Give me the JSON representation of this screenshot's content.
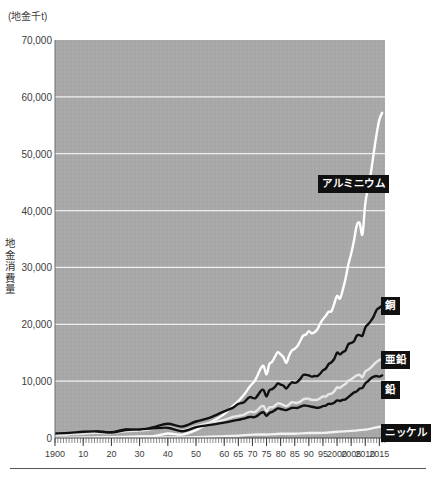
{
  "figure": {
    "unit_label": "(地金千t)",
    "y_axis_title": "地金消費量",
    "plot": {
      "x": 55,
      "y": 40,
      "width": 330,
      "height": 398
    },
    "background_color": "#a8a8a8",
    "gridline_color": "#f0f0f0",
    "axis_text_color": "#3c3c3c",
    "label_box_color": "#101010",
    "label_text_color": "#ffffff"
  },
  "chart_data": {
    "type": "line",
    "title": "",
    "subtitle": "",
    "xlabel": "",
    "ylabel": "地金消費量",
    "unit": "地金千t",
    "xlim": [
      1900,
      2017
    ],
    "ylim": [
      0,
      70000
    ],
    "grid": true,
    "grid_axis": "y",
    "legend_position": "inline-right",
    "y_ticks": [
      0,
      10000,
      20000,
      30000,
      40000,
      50000,
      60000,
      70000
    ],
    "y_tick_labels": [
      "0",
      "10,000",
      "20,000",
      "30,000",
      "40,000",
      "50,000",
      "60,000",
      "70,000"
    ],
    "x_ticks": [
      1900,
      1910,
      1920,
      1930,
      1940,
      1950,
      1960,
      1965,
      1970,
      1975,
      1980,
      1985,
      1990,
      1995,
      2000,
      2005,
      2010,
      2015
    ],
    "x_tick_labels": [
      "1900",
      "10",
      "20",
      "30",
      "40",
      "50",
      "60",
      "65",
      "70",
      "75",
      "80",
      "85",
      "90",
      "95",
      "2000",
      "2005",
      "2010",
      "2015"
    ],
    "series": [
      {
        "name": "アルミニウム",
        "color": "#ffffff",
        "label_x": 318,
        "label_y": 175,
        "x": [
          1900,
          1905,
          1910,
          1915,
          1920,
          1925,
          1930,
          1935,
          1940,
          1945,
          1950,
          1955,
          1960,
          1963,
          1965,
          1967,
          1969,
          1971,
          1973,
          1974,
          1975,
          1976,
          1977,
          1978,
          1979,
          1980,
          1981,
          1982,
          1983,
          1984,
          1985,
          1986,
          1987,
          1988,
          1989,
          1990,
          1991,
          1992,
          1993,
          1994,
          1995,
          1996,
          1997,
          1998,
          1999,
          2000,
          2001,
          2002,
          2003,
          2004,
          2005,
          2006,
          2007,
          2008,
          2009,
          2010,
          2011,
          2012,
          2013,
          2014,
          2015,
          2016
        ],
        "values": [
          5,
          12,
          45,
          100,
          130,
          180,
          270,
          340,
          800,
          600,
          1400,
          2700,
          4200,
          5600,
          6500,
          7600,
          9000,
          10200,
          12300,
          12600,
          11200,
          13000,
          13400,
          14300,
          15100,
          14700,
          14200,
          13200,
          14500,
          15400,
          15700,
          16200,
          17100,
          18000,
          18200,
          18800,
          18400,
          18600,
          19100,
          20100,
          20900,
          21500,
          22200,
          22300,
          23600,
          25000,
          24500,
          26000,
          28000,
          30500,
          32400,
          34700,
          37400,
          37800,
          35800,
          41200,
          44100,
          46700,
          50100,
          53400,
          56000,
          57200
        ]
      },
      {
        "name": "銅",
        "color": "#111111",
        "label_x": 381,
        "label_y": 297,
        "x": [
          1900,
          1905,
          1910,
          1915,
          1920,
          1925,
          1930,
          1935,
          1940,
          1945,
          1950,
          1955,
          1960,
          1963,
          1965,
          1967,
          1969,
          1971,
          1973,
          1974,
          1975,
          1976,
          1977,
          1978,
          1979,
          1980,
          1981,
          1982,
          1983,
          1984,
          1985,
          1986,
          1987,
          1988,
          1989,
          1990,
          1991,
          1992,
          1993,
          1994,
          1995,
          1996,
          1997,
          1998,
          1999,
          2000,
          2001,
          2002,
          2003,
          2004,
          2005,
          2006,
          2007,
          2008,
          2009,
          2010,
          2011,
          2012,
          2013,
          2014,
          2015,
          2016
        ],
        "values": [
          500,
          650,
          900,
          1100,
          1000,
          1500,
          1400,
          1900,
          2500,
          2000,
          2900,
          3600,
          4700,
          5300,
          6000,
          6300,
          7200,
          7000,
          8300,
          8400,
          7300,
          8400,
          8600,
          9000,
          9600,
          9400,
          9200,
          8700,
          9300,
          9800,
          9700,
          9900,
          10400,
          11100,
          11100,
          11000,
          10800,
          10900,
          10900,
          11300,
          11900,
          12200,
          13000,
          13300,
          13900,
          15000,
          14700,
          15100,
          15400,
          16500,
          16700,
          17000,
          18000,
          18100,
          18000,
          19400,
          20000,
          20600,
          21400,
          22500,
          22900,
          23300
        ]
      },
      {
        "name": "亜鉛",
        "color": "#e8e8e8",
        "label_x": 381,
        "label_y": 351,
        "x": [
          1900,
          1905,
          1910,
          1915,
          1920,
          1925,
          1930,
          1935,
          1940,
          1945,
          1950,
          1955,
          1960,
          1963,
          1965,
          1967,
          1969,
          1971,
          1973,
          1974,
          1975,
          1976,
          1977,
          1978,
          1979,
          1980,
          1981,
          1982,
          1983,
          1984,
          1985,
          1986,
          1987,
          1988,
          1989,
          1990,
          1991,
          1992,
          1993,
          1994,
          1995,
          1996,
          1997,
          1998,
          1999,
          2000,
          2001,
          2002,
          2003,
          2004,
          2005,
          2006,
          2007,
          2008,
          2009,
          2010,
          2011,
          2012,
          2013,
          2014,
          2015,
          2016
        ],
        "values": [
          450,
          600,
          800,
          900,
          850,
          1200,
          1300,
          1600,
          1900,
          1300,
          2100,
          2700,
          3200,
          3700,
          3900,
          4100,
          4600,
          4600,
          5500,
          5600,
          4700,
          5400,
          5400,
          5700,
          6100,
          6000,
          5800,
          5600,
          5900,
          6300,
          6200,
          6200,
          6400,
          6800,
          6900,
          6900,
          6700,
          6700,
          6700,
          7000,
          7300,
          7300,
          7700,
          7800,
          8200,
          8900,
          8800,
          9200,
          9500,
          10100,
          10300,
          10700,
          11000,
          11100,
          10700,
          11700,
          12000,
          12400,
          12900,
          13400,
          13700,
          13900
        ]
      },
      {
        "name": "鉛",
        "color": "#111111",
        "label_x": 381,
        "label_y": 381,
        "x": [
          1900,
          1905,
          1910,
          1915,
          1920,
          1925,
          1930,
          1935,
          1940,
          1945,
          1950,
          1955,
          1960,
          1963,
          1965,
          1967,
          1969,
          1971,
          1973,
          1974,
          1975,
          1976,
          1977,
          1978,
          1979,
          1980,
          1981,
          1982,
          1983,
          1984,
          1985,
          1986,
          1987,
          1988,
          1989,
          1990,
          1991,
          1992,
          1993,
          1994,
          1995,
          1996,
          1997,
          1998,
          1999,
          2000,
          2001,
          2002,
          2003,
          2004,
          2005,
          2006,
          2007,
          2008,
          2009,
          2010,
          2011,
          2012,
          2013,
          2014,
          2015,
          2016
        ],
        "values": [
          800,
          900,
          1100,
          1150,
          950,
          1400,
          1500,
          1700,
          1800,
          1200,
          1900,
          2300,
          2700,
          3000,
          3200,
          3400,
          3700,
          3700,
          4400,
          4500,
          3900,
          4400,
          4600,
          4900,
          5200,
          5100,
          5000,
          4900,
          5100,
          5300,
          5300,
          5300,
          5500,
          5700,
          5700,
          5600,
          5500,
          5400,
          5300,
          5400,
          5600,
          5700,
          6000,
          6000,
          6200,
          6600,
          6500,
          6700,
          6800,
          7200,
          7600,
          8000,
          8200,
          8700,
          8800,
          9600,
          10000,
          10500,
          10800,
          10900,
          10800,
          11000
        ]
      },
      {
        "name": "ニッケル",
        "color": "#f2f2f2",
        "label_x": 381,
        "label_y": 424,
        "x": [
          1900,
          1910,
          1920,
          1930,
          1940,
          1950,
          1960,
          1965,
          1970,
          1975,
          1980,
          1985,
          1990,
          1995,
          2000,
          2005,
          2010,
          2012,
          2014,
          2016
        ],
        "values": [
          10,
          20,
          40,
          60,
          110,
          140,
          330,
          400,
          600,
          620,
          740,
          760,
          880,
          900,
          1100,
          1250,
          1470,
          1660,
          1870,
          2000
        ]
      }
    ]
  }
}
